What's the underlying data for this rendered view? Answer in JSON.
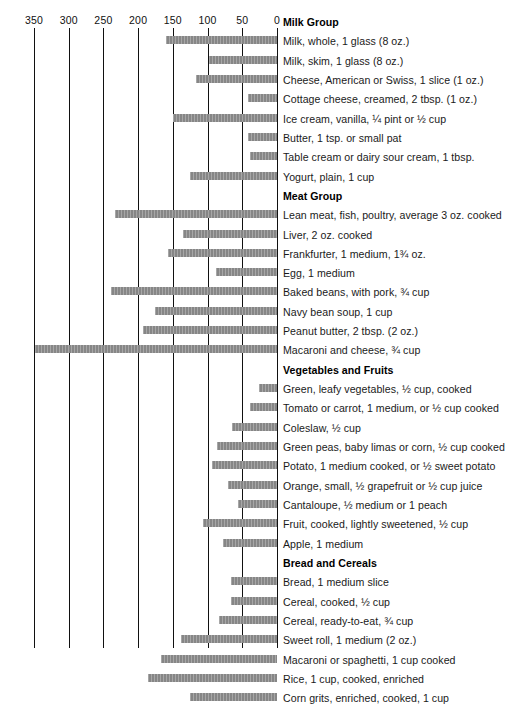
{
  "chart_data": {
    "type": "bar",
    "orientation": "horizontal-right-to-left",
    "title": "",
    "xlabel": "",
    "ylabel": "",
    "xlim": [
      0,
      350
    ],
    "axis_reversed": true,
    "grid": true,
    "legend": null,
    "tick_labels": [
      "350",
      "300",
      "250",
      "200",
      "150",
      "100",
      "50",
      "0"
    ],
    "ticks": [
      350,
      300,
      250,
      200,
      150,
      100,
      50,
      0
    ],
    "groups": [
      {
        "name": "Milk Group",
        "items": [
          {
            "label": "Milk, whole, 1 glass (8 oz.)",
            "value": 160
          },
          {
            "label": "Milk, skim, 1 glass (8 oz.)",
            "value": 98
          },
          {
            "label": "Cheese, American or Swiss, 1 slice (1 oz.)",
            "value": 117
          },
          {
            "label": "Cottage cheese, creamed, 2 tbsp. (1 oz.)",
            "value": 42
          },
          {
            "label": "Ice cream, vanilla, ¼ pint or ½ cup",
            "value": 150
          },
          {
            "label": "Butter, 1 tsp. or small pat",
            "value": 42
          },
          {
            "label": "Table cream or dairy sour cream, 1 tbsp.",
            "value": 39
          },
          {
            "label": "Yogurt, plain, 1 cup",
            "value": 125
          }
        ]
      },
      {
        "name": "Meat Group",
        "items": [
          {
            "label": "Lean meat, fish, poultry, average 3 oz. cooked",
            "value": 233
          },
          {
            "label": "Liver, 2 oz. cooked",
            "value": 135
          },
          {
            "label": "Frankfurter, 1 medium, 1¾ oz.",
            "value": 157
          },
          {
            "label": "Egg, 1 medium",
            "value": 88
          },
          {
            "label": "Baked beans, with pork, ¾ cup",
            "value": 239
          },
          {
            "label": "Navy bean soup, 1 cup",
            "value": 176
          },
          {
            "label": "Peanut butter, 2 tbsp. (2 oz.)",
            "value": 193
          },
          {
            "label": "Macaroni and cheese, ¾ cup",
            "value": 348
          }
        ]
      },
      {
        "name": "Vegetables and Fruits",
        "items": [
          {
            "label": "Green, leafy vegetables, ½ cup, cooked",
            "value": 26
          },
          {
            "label": "Tomato or carrot, 1 medium, or ½ cup cooked",
            "value": 39
          },
          {
            "label": "Coleslaw, ½ cup",
            "value": 65
          },
          {
            "label": "Green peas, baby limas or corn, ½ cup cooked",
            "value": 86
          },
          {
            "label": "Potato, 1 medium cooked, or ½ sweet potato",
            "value": 94
          },
          {
            "label": "Orange, small, ½ grapefruit or ½ cup juice",
            "value": 71
          },
          {
            "label": "Cantaloupe, ½ medium or 1 peach",
            "value": 56
          },
          {
            "label": "Fruit, cooked, lightly sweetened, ½ cup",
            "value": 107
          },
          {
            "label": "Apple, 1 medium",
            "value": 78
          }
        ]
      },
      {
        "name": "Bread and Cereals",
        "items": [
          {
            "label": "Bread, 1 medium slice",
            "value": 66
          },
          {
            "label": "Cereal, cooked, ½ cup",
            "value": 66
          },
          {
            "label": "Cereal, ready-to-eat, ¾ cup",
            "value": 84
          },
          {
            "label": "Sweet roll, 1 medium (2 oz.)",
            "value": 138
          },
          {
            "label": "Macaroni or spaghetti, 1 cup cooked",
            "value": 167
          },
          {
            "label": "Rice, 1 cup, cooked, enriched",
            "value": 186
          },
          {
            "label": "Corn grits, enriched, cooked, 1 cup",
            "value": 125
          }
        ]
      }
    ],
    "colors": {
      "bar": "#8e8e8e",
      "axis": "#111111",
      "text": "#1a1a1a",
      "background": "#ffffff"
    }
  }
}
